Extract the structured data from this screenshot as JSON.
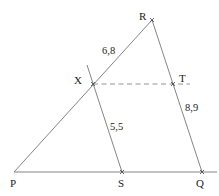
{
  "diagram": {
    "points": {
      "P": {
        "label": "P",
        "x": 14,
        "y": 172
      },
      "S": {
        "label": "S",
        "x": 122,
        "y": 172
      },
      "Q": {
        "label": "Q",
        "x": 202,
        "y": 172
      },
      "R": {
        "label": "R",
        "x": 152,
        "y": 20
      },
      "X": {
        "label": "X",
        "x": 93,
        "y": 84
      },
      "T": {
        "label": "T",
        "x": 173,
        "y": 84
      }
    },
    "measurements": {
      "RX": "6,8",
      "XS": "5,5",
      "TQ": "8,9"
    },
    "segments": [
      "PQ",
      "PR",
      "RQ",
      "XS",
      "XT (dashed)"
    ]
  }
}
